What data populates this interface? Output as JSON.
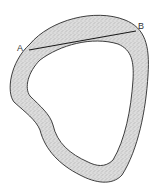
{
  "diagram": {
    "type": "ring-shape-with-chord",
    "points": [
      {
        "id": "A",
        "label": "A",
        "x": 29,
        "y": 50
      },
      {
        "id": "B",
        "label": "B",
        "x": 136,
        "y": 31
      }
    ],
    "chord": {
      "from": "A",
      "to": "B"
    },
    "colors": {
      "fill": "#d6d6d6",
      "stipple": "#8a8a8a",
      "outline": "#2a2a2a",
      "background": "#ffffff",
      "label": "#333333"
    }
  }
}
